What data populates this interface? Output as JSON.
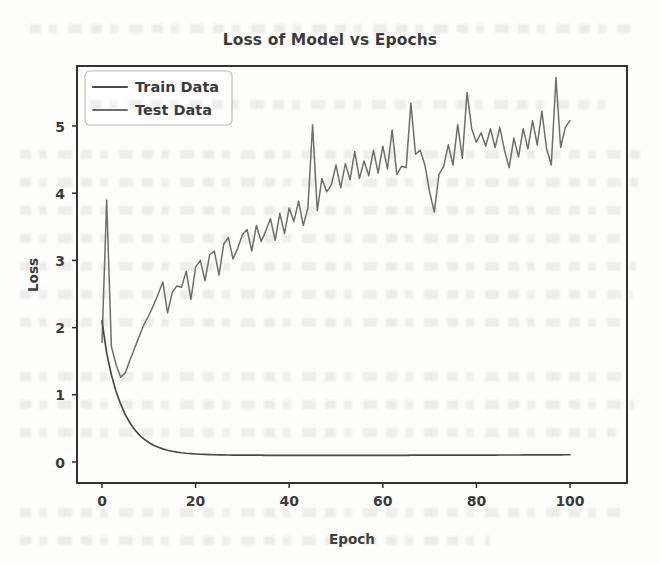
{
  "figure": {
    "background_color": "#fdfdfc",
    "scan_artifact": "faint-bleed-through-text"
  },
  "chart_data": {
    "type": "line",
    "title": "Loss of Model vs Epochs",
    "xlabel": "Epoch",
    "ylabel": "Loss",
    "xlim": [
      -4.5,
      104.5
    ],
    "ylim": [
      -0.28,
      6.25
    ],
    "xticks": [
      0,
      20,
      40,
      60,
      80,
      100
    ],
    "yticks": [
      0,
      1,
      2,
      3,
      4,
      5
    ],
    "xtick_labels": [
      "0",
      "20",
      "40",
      "60",
      "80",
      "100"
    ],
    "ytick_labels": [
      "0",
      "1",
      "2",
      "3",
      "4",
      "5"
    ],
    "grid": false,
    "legend": {
      "position": "upper left",
      "entries": [
        "Train Data",
        "Test Data"
      ]
    },
    "series": [
      {
        "name": "Train Data",
        "color": "#4a4a4a",
        "linewidth": 1.7,
        "x": [
          0,
          1,
          2,
          3,
          4,
          5,
          6,
          7,
          8,
          9,
          10,
          11,
          12,
          13,
          14,
          15,
          16,
          17,
          18,
          19,
          20,
          21,
          22,
          23,
          24,
          25,
          26,
          27,
          28,
          29,
          30,
          31,
          32,
          33,
          34,
          35,
          36,
          37,
          38,
          39,
          40,
          41,
          42,
          43,
          44,
          45,
          46,
          47,
          48,
          49,
          50,
          51,
          52,
          53,
          54,
          55,
          56,
          57,
          58,
          59,
          60,
          61,
          62,
          63,
          64,
          65,
          66,
          67,
          68,
          69,
          70,
          71,
          72,
          73,
          74,
          75,
          76,
          77,
          78,
          79,
          80,
          81,
          82,
          83,
          84,
          85,
          86,
          87,
          88,
          89,
          90,
          91,
          92,
          93,
          94,
          95,
          96,
          97,
          98,
          99,
          100
        ],
        "y": [
          2.1,
          1.62,
          1.3,
          1.05,
          0.86,
          0.7,
          0.58,
          0.48,
          0.4,
          0.34,
          0.29,
          0.25,
          0.22,
          0.195,
          0.175,
          0.16,
          0.148,
          0.138,
          0.13,
          0.124,
          0.119,
          0.115,
          0.112,
          0.11,
          0.108,
          0.106,
          0.105,
          0.104,
          0.103,
          0.103,
          0.102,
          0.102,
          0.101,
          0.101,
          0.101,
          0.1,
          0.1,
          0.1,
          0.1,
          0.1,
          0.1,
          0.099,
          0.099,
          0.099,
          0.099,
          0.099,
          0.099,
          0.099,
          0.099,
          0.099,
          0.099,
          0.099,
          0.099,
          0.099,
          0.099,
          0.099,
          0.1,
          0.1,
          0.1,
          0.1,
          0.1,
          0.1,
          0.1,
          0.1,
          0.1,
          0.1,
          0.101,
          0.101,
          0.101,
          0.101,
          0.101,
          0.101,
          0.101,
          0.102,
          0.102,
          0.102,
          0.102,
          0.102,
          0.102,
          0.102,
          0.103,
          0.103,
          0.103,
          0.103,
          0.103,
          0.104,
          0.104,
          0.104,
          0.104,
          0.104,
          0.105,
          0.105,
          0.105,
          0.105,
          0.106,
          0.106,
          0.106,
          0.107,
          0.107,
          0.108,
          0.108
        ]
      },
      {
        "name": "Test Data",
        "color": "#6e6e6e",
        "linewidth": 1.5,
        "x": [
          0,
          1,
          2,
          3,
          4,
          5,
          6,
          7,
          8,
          9,
          10,
          11,
          12,
          13,
          14,
          15,
          16,
          17,
          18,
          19,
          20,
          21,
          22,
          23,
          24,
          25,
          26,
          27,
          28,
          29,
          30,
          31,
          32,
          33,
          34,
          35,
          36,
          37,
          38,
          39,
          40,
          41,
          42,
          43,
          44,
          45,
          46,
          47,
          48,
          49,
          50,
          51,
          52,
          53,
          54,
          55,
          56,
          57,
          58,
          59,
          60,
          61,
          62,
          63,
          64,
          65,
          66,
          67,
          68,
          69,
          70,
          71,
          72,
          73,
          74,
          75,
          76,
          77,
          78,
          79,
          80,
          81,
          82,
          83,
          84,
          85,
          86,
          87,
          88,
          89,
          90,
          91,
          92,
          93,
          94,
          95,
          96,
          97,
          98,
          99,
          100
        ],
        "y": [
          1.78,
          3.9,
          1.72,
          1.45,
          1.26,
          1.33,
          1.52,
          1.7,
          1.88,
          2.05,
          2.18,
          2.33,
          2.5,
          2.68,
          2.22,
          2.52,
          2.62,
          2.6,
          2.84,
          2.42,
          2.9,
          3.0,
          2.7,
          3.08,
          3.14,
          2.78,
          3.24,
          3.34,
          3.02,
          3.18,
          3.38,
          3.46,
          3.14,
          3.52,
          3.28,
          3.44,
          3.62,
          3.3,
          3.7,
          3.4,
          3.78,
          3.58,
          3.88,
          3.52,
          3.78,
          5.02,
          3.74,
          4.22,
          4.02,
          4.12,
          4.42,
          4.08,
          4.44,
          4.2,
          4.62,
          4.22,
          4.48,
          4.26,
          4.64,
          4.3,
          4.7,
          4.36,
          4.94,
          4.28,
          4.4,
          4.38,
          5.34,
          4.58,
          4.64,
          4.42,
          4.02,
          3.72,
          4.28,
          4.4,
          4.72,
          4.42,
          5.02,
          4.52,
          5.5,
          4.96,
          4.76,
          4.9,
          4.7,
          4.96,
          4.68,
          4.98,
          4.64,
          4.38,
          4.82,
          4.54,
          4.96,
          4.66,
          5.08,
          4.72,
          5.22,
          4.66,
          4.42,
          5.72,
          4.68,
          4.98,
          5.08
        ]
      }
    ]
  }
}
